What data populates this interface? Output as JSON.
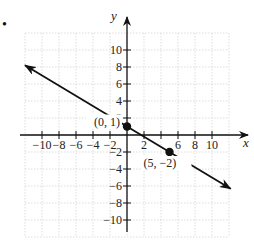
{
  "problem_marker": "•",
  "chart_data": {
    "type": "line",
    "title": "",
    "xlabel": "x",
    "ylabel": "y",
    "xlim": [
      -12,
      12
    ],
    "ylim": [
      -12,
      12
    ],
    "grid": true,
    "x_ticks": [
      -10,
      -8,
      -6,
      -4,
      -2,
      2,
      4,
      6,
      8,
      10
    ],
    "x_tick_labels": [
      "−10",
      "−8",
      "−6",
      "−4",
      "−2",
      "2",
      "",
      "6",
      "8",
      "10"
    ],
    "y_ticks": [
      10,
      8,
      6,
      4,
      2,
      -2,
      -4,
      -6,
      -8,
      -10
    ],
    "y_tick_labels": [
      "10",
      "8",
      "6",
      "4",
      "2",
      "−2",
      "−4",
      "−6",
      "−8",
      "−10"
    ],
    "series": [
      {
        "name": "line",
        "equation": "y = -3/5 x + 1",
        "slope": -0.6,
        "intercept": 1,
        "x": [
          -12,
          12
        ],
        "y": [
          8.2,
          -6.2
        ],
        "arrows": "both"
      }
    ],
    "points": [
      {
        "x": 0,
        "y": 1,
        "label": "(0, 1)"
      },
      {
        "x": 5,
        "y": -2,
        "label": "(5, −2)"
      }
    ]
  }
}
